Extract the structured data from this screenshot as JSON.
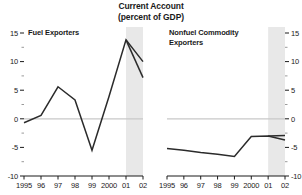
{
  "figure": {
    "title_line1": "Current Account",
    "title_line2": "(percent of GDP)"
  },
  "chart_data": [
    {
      "type": "line",
      "title": "Fuel Exporters",
      "panel": "left",
      "xlabel": "",
      "ylabel": "",
      "ylim": [
        -10,
        15
      ],
      "yticks": [
        15,
        10,
        5,
        0,
        -5,
        -10
      ],
      "ytick_labels": [
        "15",
        "10",
        "5",
        "0",
        "-5",
        "-10"
      ],
      "y_minor_ticks": [
        12.5,
        7.5,
        2.5,
        -2.5,
        -7.5
      ],
      "axis_side": "left",
      "grid": false,
      "zero_line": true,
      "legend": "none",
      "x": [
        1995,
        1996,
        1997,
        1998,
        1999,
        2000,
        2001,
        2002
      ],
      "xtick_labels": [
        "1995",
        "96",
        "97",
        "98",
        "99",
        "2000",
        "01",
        "02"
      ],
      "shaded_band": {
        "from": 2001,
        "to": 2002,
        "color": "#e8e8e8",
        "label": ""
      },
      "series": [
        {
          "name": "current-account-main",
          "values": [
            -0.7,
            0.6,
            5.6,
            3.3,
            -5.5,
            3.9,
            13.8,
            10.0
          ]
        },
        {
          "name": "current-account-alt",
          "x": [
            2001,
            2002
          ],
          "values": [
            13.8,
            7.2
          ]
        }
      ]
    },
    {
      "type": "line",
      "title": "Nonfuel Commodity\nExporters",
      "panel": "right",
      "xlabel": "",
      "ylabel": "",
      "ylim": [
        -10,
        15
      ],
      "yticks": [
        15,
        10,
        5,
        0,
        -5,
        -10
      ],
      "ytick_labels": [
        "15",
        "10",
        "5",
        "0",
        "-5",
        "-10"
      ],
      "y_minor_ticks": [
        12.5,
        7.5,
        2.5,
        -2.5,
        -7.5
      ],
      "axis_side": "right",
      "grid": false,
      "zero_line": true,
      "legend": "none",
      "x": [
        1995,
        1996,
        1997,
        1998,
        1999,
        2000,
        2001,
        2002
      ],
      "xtick_labels": [
        "1995",
        "96",
        "97",
        "98",
        "99",
        "2000",
        "01",
        "02"
      ],
      "shaded_band": {
        "from": 2001,
        "to": 2002,
        "color": "#e8e8e8",
        "label": ""
      },
      "series": [
        {
          "name": "current-account-main",
          "values": [
            -5.2,
            -5.5,
            -5.9,
            -6.2,
            -6.6,
            -3.1,
            -3.0,
            -3.7
          ]
        },
        {
          "name": "current-account-alt",
          "x": [
            2001,
            2002
          ],
          "values": [
            -3.0,
            -2.9
          ]
        }
      ]
    }
  ]
}
